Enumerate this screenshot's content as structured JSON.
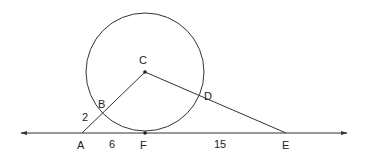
{
  "diagram": {
    "type": "geometry",
    "circle": {
      "center_label": "C",
      "cx": 145,
      "cy": 72,
      "r": 59
    },
    "points": [
      {
        "id": "C",
        "label": "C",
        "x": 145,
        "y": 72,
        "lx": 139,
        "ly": 64
      },
      {
        "id": "B",
        "label": "B",
        "x": 102,
        "y": 113,
        "lx": 98,
        "ly": 108
      },
      {
        "id": "D",
        "label": "D",
        "x": 201,
        "y": 95,
        "lx": 204,
        "ly": 100
      },
      {
        "id": "A",
        "label": "A",
        "x": 82,
        "y": 133,
        "lx": 77,
        "ly": 149
      },
      {
        "id": "F",
        "label": "F",
        "x": 145,
        "y": 133,
        "lx": 140,
        "ly": 149
      },
      {
        "id": "E",
        "label": "E",
        "x": 286,
        "y": 133,
        "lx": 282,
        "ly": 149
      }
    ],
    "segment_labels": [
      {
        "id": "AB",
        "text": "2",
        "x": 82,
        "y": 121
      },
      {
        "id": "AF",
        "text": "6",
        "x": 109,
        "y": 148
      },
      {
        "id": "FE",
        "text": "15",
        "x": 214,
        "y": 148
      }
    ],
    "line": {
      "x1": 21,
      "x2": 347,
      "y": 133,
      "arrows": "both"
    }
  }
}
